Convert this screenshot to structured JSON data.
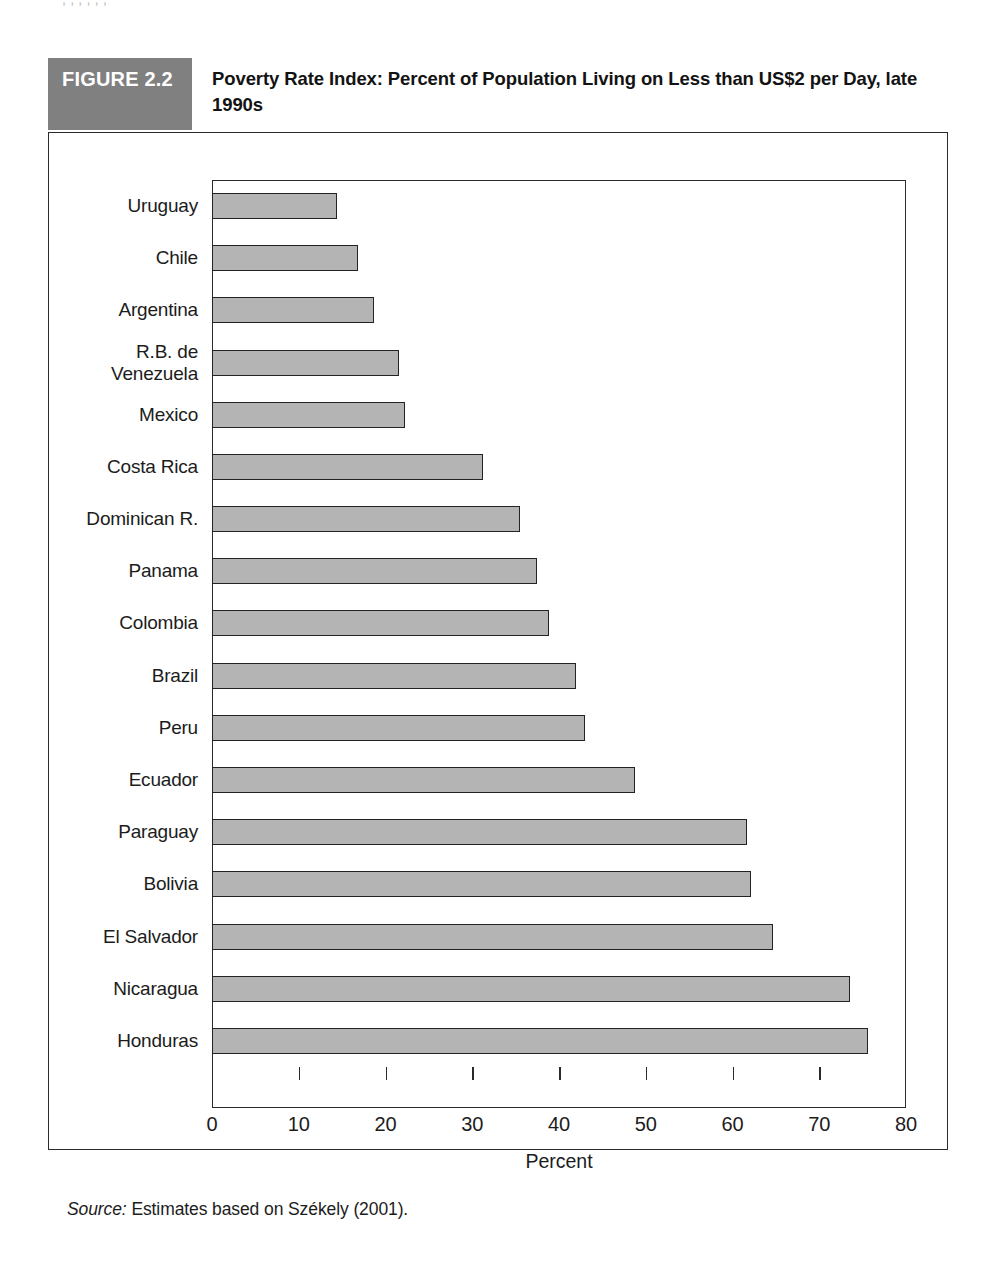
{
  "page": {
    "top_cropped_text": ",          ,                      ,              ,      ,      ,"
  },
  "figure": {
    "tag": "FIGURE 2.2",
    "title": "Poverty Rate Index: Percent of Population Living on Less than US$2 per Day, late 1990s",
    "source_lead": "Source:",
    "source_text": " Estimates based on Székely (2001).",
    "colors": {
      "tag_background": "#808080",
      "tag_text": "#ffffff",
      "bar_fill": "#b4b4b4",
      "bar_border": "#232323",
      "frame": "#2a2a2a",
      "box_border": "#2b2b2b"
    }
  },
  "chart_data": {
    "type": "bar",
    "orientation": "horizontal",
    "title": "Poverty Rate Index: Percent of Population Living on Less than US$2 per Day, late 1990s",
    "xlabel": "Percent",
    "ylabel": "",
    "xlim": [
      0,
      80
    ],
    "xticks": [
      0,
      10,
      20,
      30,
      40,
      50,
      60,
      70,
      80
    ],
    "xtick_labels": [
      "0",
      "10",
      "20",
      "30",
      "40",
      "50",
      "60",
      "70",
      "80"
    ],
    "grid": false,
    "legend": null,
    "categories": [
      "Uruguay",
      "Chile",
      "Argentina",
      "R.B. de\nVenezuela",
      "Mexico",
      "Costa Rica",
      "Dominican R.",
      "Panama",
      "Colombia",
      "Brazil",
      "Peru",
      "Ecuador",
      "Paraguay",
      "Bolivia",
      "El Salvador",
      "Nicaragua",
      "Honduras"
    ],
    "values": [
      14.4,
      16.8,
      18.7,
      21.5,
      22.2,
      31.2,
      35.5,
      37.5,
      38.8,
      42.0,
      43.0,
      48.8,
      61.7,
      62.1,
      64.7,
      73.5,
      75.6
    ],
    "source": "Estimates based on Székely (2001)."
  }
}
